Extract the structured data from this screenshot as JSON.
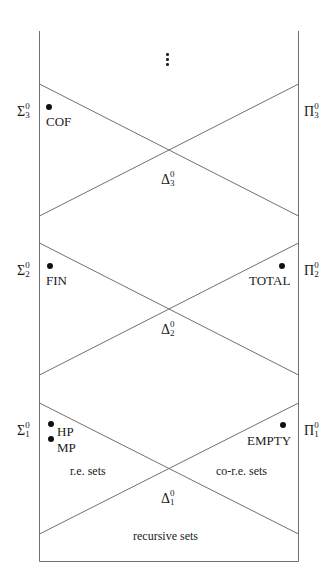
{
  "diagram": {
    "continuation": "⋮",
    "levels": [
      {
        "level": 3,
        "sigma": {
          "base": "Σ",
          "sup": "0",
          "sub": "3"
        },
        "pi": {
          "base": "Π",
          "sup": "0",
          "sub": "3"
        },
        "delta": {
          "base": "Δ",
          "sup": "0",
          "sub": "3"
        },
        "sigma_examples": [
          "COF"
        ],
        "pi_examples": []
      },
      {
        "level": 2,
        "sigma": {
          "base": "Σ",
          "sup": "0",
          "sub": "2"
        },
        "pi": {
          "base": "Π",
          "sup": "0",
          "sub": "2"
        },
        "delta": {
          "base": "Δ",
          "sup": "0",
          "sub": "2"
        },
        "sigma_examples": [
          "FIN"
        ],
        "pi_examples": [
          "TOTAL"
        ]
      },
      {
        "level": 1,
        "sigma": {
          "base": "Σ",
          "sup": "0",
          "sub": "1"
        },
        "pi": {
          "base": "Π",
          "sup": "0",
          "sub": "1"
        },
        "delta": {
          "base": "Δ",
          "sup": "0",
          "sub": "1"
        },
        "sigma_examples": [
          "HP",
          "MP"
        ],
        "pi_examples": [
          "EMPTY"
        ],
        "sigma_region_label": "r.e. sets",
        "pi_region_label": "co-r.e. sets"
      }
    ],
    "base_region_label": "recursive sets",
    "colors": {
      "line": "#6e6e6e",
      "text": "#1a1a1a",
      "dot": "#111111"
    }
  }
}
